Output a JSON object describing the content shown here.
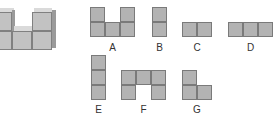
{
  "figure": {
    "solid": {
      "description": "3D stack of cubes: two columns of two cubes with one cube between at bottom"
    },
    "options": [
      {
        "label": "A",
        "cells": [
          [
            0,
            0
          ],
          [
            2,
            0
          ],
          [
            0,
            1
          ],
          [
            1,
            1
          ],
          [
            2,
            1
          ]
        ]
      },
      {
        "label": "B",
        "cells": [
          [
            0,
            0
          ],
          [
            0,
            1
          ]
        ]
      },
      {
        "label": "C",
        "cells": [
          [
            0,
            0
          ],
          [
            1,
            0
          ]
        ]
      },
      {
        "label": "D",
        "cells": [
          [
            0,
            0
          ],
          [
            1,
            0
          ],
          [
            2,
            0
          ]
        ]
      },
      {
        "label": "E",
        "cells": [
          [
            0,
            0
          ],
          [
            0,
            1
          ],
          [
            0,
            2
          ]
        ]
      },
      {
        "label": "F",
        "cells": [
          [
            0,
            0
          ],
          [
            1,
            0
          ],
          [
            2,
            0
          ],
          [
            0,
            1
          ],
          [
            2,
            1
          ]
        ]
      },
      {
        "label": "G",
        "cells": [
          [
            0,
            0
          ],
          [
            0,
            1
          ],
          [
            1,
            1
          ]
        ]
      }
    ],
    "colors": {
      "square_fill": "#b3b3b3",
      "square_border": "#7a7a7a"
    }
  }
}
